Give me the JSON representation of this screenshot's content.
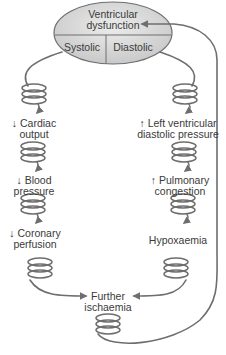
{
  "diagram": {
    "title": [
      "Ventricular",
      "dysfunction"
    ],
    "split": {
      "left": "Systolic",
      "right": "Diastolic"
    },
    "left_chain": [
      {
        "line1": "↓ Cardiac",
        "line2": "output"
      },
      {
        "line1": "↓ Blood",
        "line2": "pressure"
      },
      {
        "line1": "↓ Coronary",
        "line2": "perfusion"
      }
    ],
    "right_chain": [
      {
        "line1": "↑ Left ventricular",
        "line2": "diastolic pressure"
      },
      {
        "line1": "↑ Pulmonary",
        "line2": "congestion"
      },
      {
        "line1": "Hypoxaemia",
        "line2": ""
      }
    ],
    "outcome": {
      "line1": "Further",
      "line2": "ischaemia"
    },
    "colors": {
      "oval_fill": "#d9d9d9",
      "stroke": "#6e6e6e",
      "text": "#3a3a3a"
    }
  }
}
